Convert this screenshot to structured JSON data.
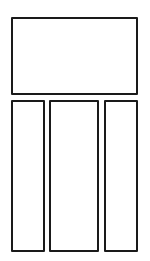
{
  "diagram": {
    "type": "layout-wireframe",
    "stroke_color": "#1a1a1a",
    "background_color": "#ffffff",
    "panels": [
      {
        "id": "top-panel",
        "label": ""
      },
      {
        "id": "col-left",
        "label": ""
      },
      {
        "id": "col-center",
        "label": ""
      },
      {
        "id": "col-right",
        "label": ""
      }
    ]
  }
}
